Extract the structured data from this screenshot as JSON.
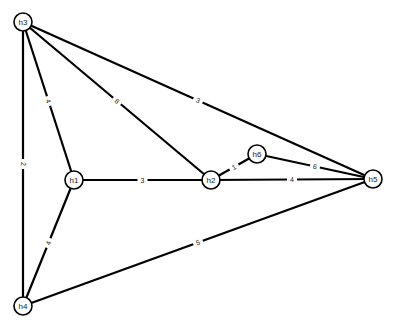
{
  "graph": {
    "nodes": [
      {
        "id": "h3",
        "label": "h3",
        "x": 23,
        "y": 22
      },
      {
        "id": "h1",
        "label": "h1",
        "x": 74,
        "y": 180
      },
      {
        "id": "h2",
        "label": "h2",
        "x": 211,
        "y": 180
      },
      {
        "id": "h6",
        "label": "h6",
        "x": 257,
        "y": 154
      },
      {
        "id": "h5",
        "label": "h5",
        "x": 373,
        "y": 179
      },
      {
        "id": "h4",
        "label": "h4",
        "x": 23,
        "y": 306
      }
    ],
    "edges": [
      {
        "from": "h3",
        "to": "h4",
        "label": "2"
      },
      {
        "from": "h3",
        "to": "h1",
        "label": "4"
      },
      {
        "from": "h3",
        "to": "h2",
        "label": "8"
      },
      {
        "from": "h3",
        "to": "h5",
        "label": "3"
      },
      {
        "from": "h1",
        "to": "h2",
        "label": "3"
      },
      {
        "from": "h1",
        "to": "h4",
        "label": "4"
      },
      {
        "from": "h2",
        "to": "h6",
        "label": "1"
      },
      {
        "from": "h2",
        "to": "h5",
        "label": "4"
      },
      {
        "from": "h6",
        "to": "h5",
        "label": "6"
      },
      {
        "from": "h4",
        "to": "h5",
        "label": "5"
      }
    ]
  }
}
